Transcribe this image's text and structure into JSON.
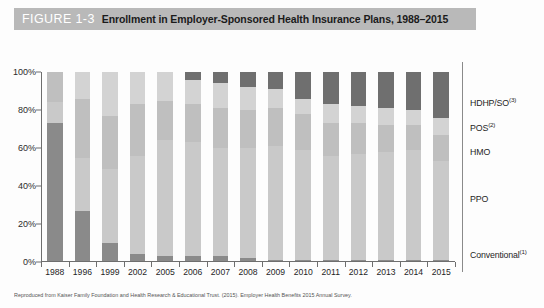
{
  "figure": {
    "number": "FIGURE 1-3",
    "title": "Enrollment in Employer-Sponsored Health Insurance Plans, 1988–2015",
    "header_bg": "#b9b9b9"
  },
  "source_note": "Reproduced from Kaiser Family Foundation and Health Research & Educational Trust. (2015). Employer Health Benefits 2015 Annual Survey.",
  "legend": {
    "items": [
      {
        "label": "HDHP/SO",
        "sup": "(3)",
        "color": "#6f6f6f",
        "y": 102
      },
      {
        "label": "POS",
        "sup": "(2)",
        "color": "#d3d3d3",
        "y": 127
      },
      {
        "label": "HMO",
        "sup": "",
        "color": "#bfbfbf",
        "y": 152
      },
      {
        "label": "PPO",
        "sup": "",
        "color": "#c9c9c9",
        "y": 199
      },
      {
        "label": "Conventional",
        "sup": "(1)",
        "color": "#8a8a8a",
        "y": 254
      }
    ]
  },
  "chart_data": {
    "type": "bar",
    "stacked": true,
    "title": "Enrollment in Employer-Sponsored Health Insurance Plans, 1988–2015",
    "xlabel": "",
    "ylabel": "",
    "ylim": [
      0,
      100
    ],
    "ytick_labels": [
      "0%",
      "20%",
      "40%",
      "60%",
      "80%",
      "100%"
    ],
    "ytick_values": [
      0,
      20,
      40,
      60,
      80,
      100
    ],
    "grid": false,
    "legend_position": "right",
    "categories": [
      "1988",
      "1996",
      "1999",
      "2002",
      "2005",
      "2006",
      "2007",
      "2008",
      "2009",
      "2010",
      "2011",
      "2012",
      "2013",
      "2014",
      "2015"
    ],
    "series": [
      {
        "name": "Conventional",
        "color": "#8a8a8a",
        "values": [
          73,
          27,
          10,
          4,
          3,
          3,
          3,
          2,
          1,
          1,
          1,
          1,
          1,
          1,
          1
        ]
      },
      {
        "name": "PPO",
        "color": "#c9c9c9",
        "values": [
          11,
          28,
          39,
          52,
          61,
          60,
          57,
          58,
          60,
          58,
          55,
          56,
          57,
          58,
          52
        ]
      },
      {
        "name": "HMO",
        "color": "#bfbfbf",
        "values": [
          16,
          31,
          28,
          27,
          21,
          20,
          21,
          20,
          20,
          19,
          17,
          16,
          14,
          13,
          14
        ]
      },
      {
        "name": "POS",
        "color": "#d3d3d3",
        "values": [
          0,
          14,
          23,
          17,
          15,
          13,
          13,
          12,
          10,
          8,
          10,
          9,
          9,
          8,
          9
        ]
      },
      {
        "name": "HDHP/SO",
        "color": "#6f6f6f",
        "values": [
          0,
          0,
          0,
          0,
          0,
          4,
          6,
          8,
          9,
          14,
          17,
          18,
          19,
          20,
          24
        ]
      }
    ]
  }
}
